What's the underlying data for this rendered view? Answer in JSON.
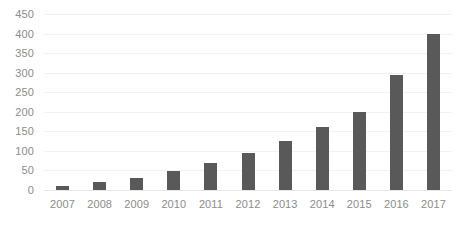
{
  "chart_data": {
    "type": "bar",
    "title": "",
    "subtitle": "",
    "xlabel": "",
    "ylabel": "",
    "categories": [
      "2007",
      "2008",
      "2009",
      "2010",
      "2011",
      "2012",
      "2013",
      "2014",
      "2015",
      "2016",
      "2017"
    ],
    "values": [
      10,
      20,
      30,
      48,
      70,
      95,
      125,
      160,
      200,
      295,
      400
    ],
    "series": [
      {
        "name": "",
        "values": [
          10,
          20,
          30,
          48,
          70,
          95,
          125,
          160,
          200,
          295,
          400
        ]
      }
    ],
    "ylim": [
      0,
      450
    ],
    "y_ticks": [
      0,
      50,
      100,
      150,
      200,
      250,
      300,
      350,
      400,
      450
    ],
    "y_tick_labels": [
      "0",
      "50",
      "100",
      "150",
      "200",
      "250",
      "300",
      "350",
      "400",
      "450"
    ],
    "grid": true,
    "grid_axis": "y",
    "legend": false,
    "legend_position": "none",
    "annotations": [],
    "data_labels": false,
    "bar_color": "#595959",
    "gridline_color": "#f2f2f2",
    "axis_text_color": "#8c8c8c",
    "background_color": "#ffffff"
  }
}
